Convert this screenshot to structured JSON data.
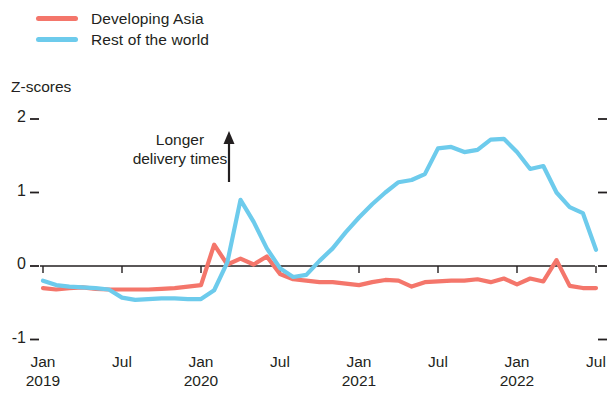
{
  "legend": {
    "items": [
      {
        "label": "Developing Asia",
        "color": "#F4766B"
      },
      {
        "label": "Rest of the world",
        "color": "#6DCBEC"
      }
    ]
  },
  "axis": {
    "y_title": "Z-scores",
    "y_ticks": [
      "2",
      "1",
      "0",
      "-1"
    ],
    "y_values": [
      2,
      1,
      0,
      -1
    ],
    "x_ticks": [
      {
        "month": "Jan",
        "year": "2019"
      },
      {
        "month": "Jul",
        "year": ""
      },
      {
        "month": "Jan",
        "year": "2020"
      },
      {
        "month": "Jul",
        "year": ""
      },
      {
        "month": "Jan",
        "year": "2021"
      },
      {
        "month": "Jul",
        "year": ""
      },
      {
        "month": "Jan",
        "year": "2022"
      },
      {
        "month": "Jul",
        "year": ""
      }
    ]
  },
  "annotation": {
    "line1": "Longer",
    "line2": "delivery times",
    "arrow": "up-arrow"
  },
  "chart_data": {
    "type": "line",
    "title": "",
    "xlabel": "",
    "ylabel": "Z-scores",
    "ylim": [
      -1,
      2
    ],
    "xlim": [
      "2019-01",
      "2022-07"
    ],
    "grid": false,
    "legend_position": "top-left",
    "zero_line": true,
    "x": [
      "2019-01",
      "2019-02",
      "2019-03",
      "2019-04",
      "2019-05",
      "2019-06",
      "2019-07",
      "2019-08",
      "2019-09",
      "2019-10",
      "2019-11",
      "2019-12",
      "2020-01",
      "2020-02",
      "2020-03",
      "2020-04",
      "2020-05",
      "2020-06",
      "2020-07",
      "2020-08",
      "2020-09",
      "2020-10",
      "2020-11",
      "2020-12",
      "2021-01",
      "2021-02",
      "2021-03",
      "2021-04",
      "2021-05",
      "2021-06",
      "2021-07",
      "2021-08",
      "2021-09",
      "2021-10",
      "2021-11",
      "2021-12",
      "2022-01",
      "2022-02",
      "2022-03",
      "2022-04",
      "2022-05",
      "2022-06",
      "2022-07"
    ],
    "series": [
      {
        "name": "Developing Asia",
        "color": "#F4766B",
        "values": [
          -0.3,
          -0.32,
          -0.3,
          -0.29,
          -0.31,
          -0.32,
          -0.32,
          -0.32,
          -0.32,
          -0.31,
          -0.3,
          -0.28,
          -0.26,
          0.29,
          0.02,
          0.1,
          0.02,
          0.13,
          -0.11,
          -0.18,
          -0.2,
          -0.22,
          -0.22,
          -0.24,
          -0.26,
          -0.22,
          -0.19,
          -0.2,
          -0.28,
          -0.22,
          -0.21,
          -0.2,
          -0.2,
          -0.18,
          -0.22,
          -0.17,
          -0.25,
          -0.17,
          -0.21,
          0.08,
          -0.27,
          -0.3,
          -0.3
        ]
      },
      {
        "name": "Rest of the world",
        "color": "#6DCBEC",
        "values": [
          -0.2,
          -0.26,
          -0.28,
          -0.29,
          -0.3,
          -0.32,
          -0.43,
          -0.46,
          -0.45,
          -0.44,
          -0.44,
          -0.45,
          -0.45,
          -0.33,
          0.05,
          0.9,
          0.6,
          0.24,
          -0.03,
          -0.15,
          -0.12,
          0.07,
          0.24,
          0.46,
          0.66,
          0.84,
          1.0,
          1.14,
          1.17,
          1.25,
          1.6,
          1.62,
          1.55,
          1.58,
          1.72,
          1.73,
          1.55,
          1.32,
          1.36,
          1.0,
          0.8,
          0.72,
          0.22
        ]
      }
    ]
  }
}
